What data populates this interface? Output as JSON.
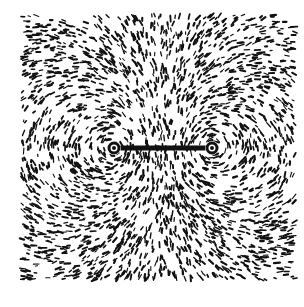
{
  "figure": {
    "background_color": "#ffffff",
    "ink_color": "#111111",
    "region": {
      "x": 22,
      "y": 15,
      "width": 273,
      "height": 265
    },
    "bar": {
      "x1": 114,
      "y1": 148,
      "x2": 212,
      "y2": 148,
      "thickness": 5
    },
    "poles": [
      {
        "cx": 114,
        "cy": 148,
        "r": 5,
        "direction": 1
      },
      {
        "cx": 212,
        "cy": 148,
        "r": 5,
        "direction": -1
      }
    ],
    "filings": {
      "count": 2600,
      "seed": 7,
      "min_len": 2,
      "max_len": 6
    }
  }
}
